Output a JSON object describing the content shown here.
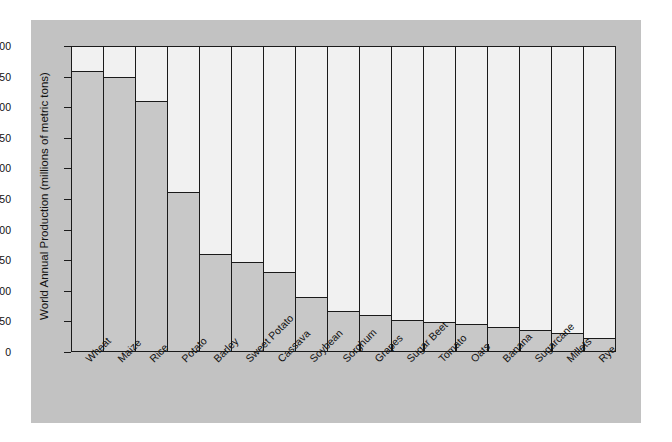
{
  "chart_data": {
    "type": "bar",
    "title": "",
    "xlabel": "",
    "ylabel": "World Annual Production (millions of metric tons)",
    "ylim": [
      0,
      500
    ],
    "yticks": [
      0,
      50,
      100,
      150,
      200,
      250,
      300,
      350,
      400,
      450,
      500
    ],
    "grid": false,
    "legend": null,
    "orientation": "vertical",
    "categories": [
      "Wheat",
      "Maize",
      "Rice",
      "Potato",
      "Barley",
      "Sweet Potato",
      "Cassava",
      "Soybean",
      "Sorghum",
      "Grapes",
      "Sugar Beet",
      "Tomato",
      "Oats",
      "Banana",
      "Sugarcane",
      "Millets",
      "Rye"
    ],
    "values": [
      460,
      450,
      412,
      262,
      159,
      146,
      130,
      89,
      66,
      59,
      51,
      48,
      44,
      39,
      34,
      30,
      22
    ],
    "colors": {
      "bar_fill": "#c8c8c8",
      "bar_edge": "#1a1a1a",
      "plot_background": "#f1f1f1",
      "figure_background": "#c2c2c2",
      "text": "#111111"
    }
  }
}
